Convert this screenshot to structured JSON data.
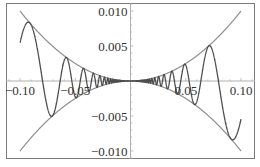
{
  "chart_data": {
    "type": "line",
    "title": "",
    "xlabel": "",
    "ylabel": "",
    "xlim": [
      -0.1127,
      0.1127
    ],
    "ylim": [
      -0.0111,
      0.0111
    ],
    "grid": false,
    "legend": null,
    "frame": true,
    "x_ticks": [
      {
        "value": -0.1,
        "label": "-0.10"
      },
      {
        "value": -0.05,
        "label": "-0.05"
      },
      {
        "value": 0.05,
        "label": "0.05"
      },
      {
        "value": 0.1,
        "label": "0.10"
      }
    ],
    "y_ticks": [
      {
        "value": 0.01,
        "label": "0.010"
      },
      {
        "value": 0.005,
        "label": "0.005"
      },
      {
        "value": -0.005,
        "label": "-0.005"
      },
      {
        "value": -0.01,
        "label": "-0.010"
      }
    ],
    "series": [
      {
        "name": "upper envelope",
        "expression": "x^2",
        "x_range": [
          -0.1,
          0.1
        ],
        "color": "#8f8f8f"
      },
      {
        "name": "lower envelope",
        "expression": "-x^2",
        "x_range": [
          -0.1,
          0.1
        ],
        "color": "#8f8f8f"
      },
      {
        "name": "oscillation",
        "expression": "x^2 sin(1/x)",
        "x_range": [
          -0.1,
          0.1
        ],
        "color": "#4d4d4d"
      }
    ],
    "annotations": []
  },
  "colors": {
    "frame": "#7a7a7a",
    "axis": "#b0b0b0",
    "tick": "#b0b0b0",
    "label": "#333333"
  },
  "layout": {
    "frame": {
      "x": 6,
      "y": 3,
      "w": 248,
      "h": 155
    },
    "origin_px": [
      130.5,
      81
    ],
    "x_scale_px_per_unit": 1105,
    "y_scale_px_per_unit": 7000
  }
}
